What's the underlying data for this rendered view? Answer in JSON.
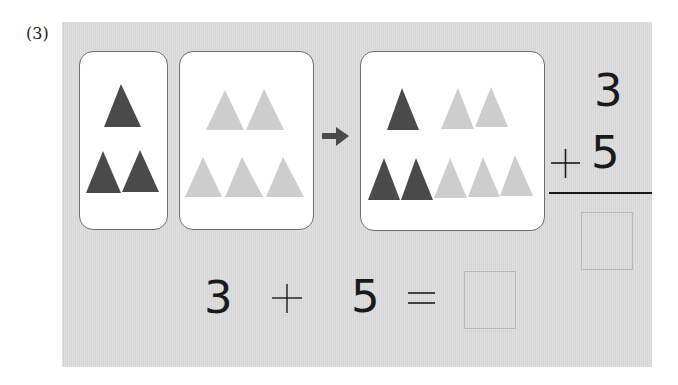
{
  "problem": {
    "label": "(3)"
  },
  "colors": {
    "panel": "#dcdcdc",
    "dark_triangle": "#4a4a4a",
    "light_triangle": "#cdcdcd",
    "card_border": "#6e6e6e",
    "ink": "#1a1a1a"
  },
  "cards": [
    {
      "name": "group-a",
      "dark_count": 3,
      "light_count": 0
    },
    {
      "name": "group-b",
      "dark_count": 0,
      "light_count": 5
    },
    {
      "name": "group-total",
      "dark_count": 3,
      "light_count": 5
    }
  ],
  "arrow": {
    "icon": "right-arrow-icon"
  },
  "vertical_sum": {
    "top": "3",
    "operator": "+",
    "bottom": "5",
    "answer": ""
  },
  "equation": {
    "left": "3",
    "operator": "+",
    "right": "5",
    "equals": "=",
    "answer": ""
  }
}
